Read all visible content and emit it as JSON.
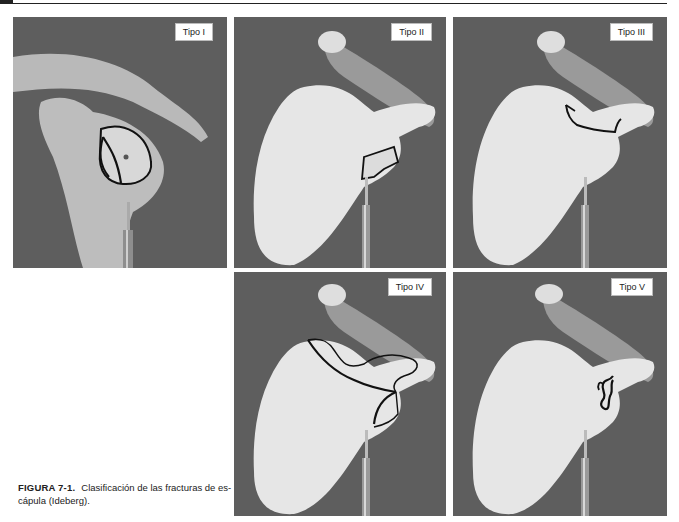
{
  "figure": {
    "number_label": "FIGURA 7-1.",
    "caption_text": "Clasificación de las fracturas de escápula (Ideberg).",
    "caption_line1": "Clasificación de las fracturas de es-",
    "caption_line2": "cápula (Ideberg)."
  },
  "panels": [
    {
      "id": "tipo-1",
      "label": "Tipo I",
      "description": "Scapula lateral view with glenoid fossa fracture outlined (anterior rim)"
    },
    {
      "id": "tipo-2",
      "label": "Tipo II",
      "description": "Scapula with inferior glenoid fracture fragment outlined"
    },
    {
      "id": "tipo-3",
      "label": "Tipo III",
      "description": "Scapula with superior glenoid fracture line outlined"
    },
    {
      "id": "tipo-4",
      "label": "Tipo IV",
      "description": "Scapula with fracture line across to medial border outlined"
    },
    {
      "id": "tipo-5",
      "label": "Tipo V",
      "description": "Scapula with comminuted glenoid fracture outlined"
    }
  ],
  "colors": {
    "background": "#5e5e5e",
    "bone": "#e6e6e6",
    "outline": "#111111",
    "label_bg": "#ffffff"
  }
}
